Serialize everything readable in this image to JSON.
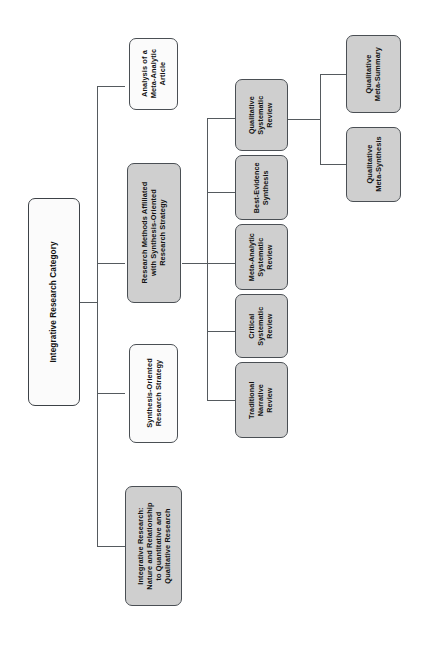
{
  "diagram": {
    "title": "Integrative Research Category",
    "orientation": "rotated-90-counterclockwise",
    "colors": {
      "white_fill": "#fbfbfb",
      "gray_fill": "#cfcfcf",
      "border": "#4a4f54",
      "line": "#555a5e",
      "text": "#121212",
      "background": "#ffffff"
    },
    "root": {
      "label": "Integrative Research Category",
      "fill": "white"
    },
    "level2": [
      {
        "label": "Integrative Research:\nNature and Relationship\nto Quantitative and\nQualitative Research",
        "line1": "Integrative Research:",
        "line2": "Nature and Relationship",
        "line3": "to Quantitative and",
        "line4": "Qualitative Research",
        "fill": "gray"
      },
      {
        "label": "Synthesis-Oriented\nResearch Strategy",
        "line1": "Synthesis-Oriented",
        "line2": "Research Strategy",
        "fill": "white"
      },
      {
        "label": "Research Methods Affiliated\nwith Synthesis-Oriented\nResearch Strategy",
        "line1": "Research Methods Affiliated",
        "line2": "with Synthesis-Oriented",
        "line3": "Research Strategy",
        "fill": "gray"
      },
      {
        "label": "Analysis of a\nMeta-Analytic\nArticle",
        "line1": "Analysis of a",
        "line2": "Meta-Analytic",
        "line3": "Article",
        "fill": "white"
      }
    ],
    "level3": [
      {
        "label": "Traditional\nNarrative\nReview",
        "line1": "Traditional",
        "line2": "Narrative",
        "line3": "Review",
        "fill": "gray"
      },
      {
        "label": "Critical\nSystematic\nReview",
        "line1": "Critical",
        "line2": "Systematic",
        "line3": "Review",
        "fill": "gray"
      },
      {
        "label": "Meta-Analytic\nSystematic\nReview",
        "line1": "Meta-Analytic",
        "line2": "Systematic",
        "line3": "Review",
        "fill": "gray"
      },
      {
        "label": "Best-Evidence\nSynthesis",
        "line1": "Best-Evidence",
        "line2": "Synthesis",
        "fill": "gray"
      },
      {
        "label": "Qualitative\nSystematic\nReview",
        "line1": "Qualitative",
        "line2": "Systematic",
        "line3": "Review",
        "fill": "gray"
      }
    ],
    "level4": [
      {
        "label": "Qualitative\nMeta-Synthesis",
        "line1": "Qualitative",
        "line2": "Meta-Synthesis",
        "fill": "gray"
      },
      {
        "label": "Qualitative\nMeta-Summary",
        "line1": "Qualitative",
        "line2": "Meta-Summary",
        "fill": "gray"
      }
    ]
  }
}
